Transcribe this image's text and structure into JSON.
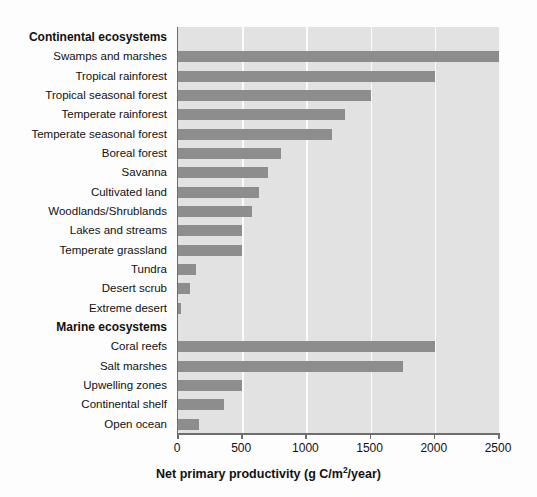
{
  "chart_data": {
    "type": "bar",
    "orientation": "horizontal",
    "title": "",
    "xlabel": "Net primary productivity (g C/m2/year)",
    "xlabel_parts": {
      "before": "Net primary productivity (g C/m",
      "sup": "2",
      "after": "/year)"
    },
    "ylabel": "",
    "xlim": [
      0,
      2500
    ],
    "xticks": [
      0,
      500,
      1000,
      1500,
      2000,
      2500
    ],
    "xticklabels": [
      "0",
      "500",
      "1000",
      "1500",
      "2000",
      "2500"
    ],
    "grid": "vertical-white",
    "legend": "none",
    "bar_color": "#8d8d8d",
    "plot_background": "#e2e2e2",
    "rows": [
      {
        "label": "Continental ecosystems",
        "is_header": true,
        "value": null
      },
      {
        "label": "Swamps and marshes",
        "is_header": false,
        "value": 2500
      },
      {
        "label": "Tropical rainforest",
        "is_header": false,
        "value": 2000
      },
      {
        "label": "Tropical seasonal forest",
        "is_header": false,
        "value": 1500
      },
      {
        "label": "Temperate rainforest",
        "is_header": false,
        "value": 1300
      },
      {
        "label": "Temperate seasonal forest",
        "is_header": false,
        "value": 1200
      },
      {
        "label": "Boreal forest",
        "is_header": false,
        "value": 800
      },
      {
        "label": "Savanna",
        "is_header": false,
        "value": 700
      },
      {
        "label": "Cultivated land",
        "is_header": false,
        "value": 630
      },
      {
        "label": "Woodlands/Shrublands",
        "is_header": false,
        "value": 580
      },
      {
        "label": "Lakes and streams",
        "is_header": false,
        "value": 500
      },
      {
        "label": "Temperate grassland",
        "is_header": false,
        "value": 500
      },
      {
        "label": "Tundra",
        "is_header": false,
        "value": 140
      },
      {
        "label": "Desert scrub",
        "is_header": false,
        "value": 90
      },
      {
        "label": "Extreme desert",
        "is_header": false,
        "value": 20
      },
      {
        "label": "Marine ecosystems",
        "is_header": true,
        "value": null
      },
      {
        "label": "Coral reefs",
        "is_header": false,
        "value": 2000
      },
      {
        "label": "Salt marshes",
        "is_header": false,
        "value": 1750
      },
      {
        "label": "Upwelling zones",
        "is_header": false,
        "value": 500
      },
      {
        "label": "Continental shelf",
        "is_header": false,
        "value": 360
      },
      {
        "label": "Open ocean",
        "is_header": false,
        "value": 160
      }
    ]
  }
}
